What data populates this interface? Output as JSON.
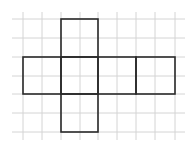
{
  "diagram": {
    "type": "cube-net-on-grid",
    "grid": {
      "vertical_x": [
        23,
        42,
        61,
        80,
        98,
        117,
        136,
        155,
        175
      ],
      "horizontal_y": [
        19,
        38,
        57,
        76,
        94,
        113,
        132
      ],
      "x_extent": [
        12,
        185
      ],
      "y_extent": [
        12,
        140
      ],
      "color": "#d4d4d4"
    },
    "net": {
      "stroke": "#2a2a2a",
      "faces": [
        {
          "name": "top",
          "x": 61,
          "y": 19,
          "w": 37,
          "h": 38
        },
        {
          "name": "left",
          "x": 23,
          "y": 57,
          "w": 38,
          "h": 37
        },
        {
          "name": "center",
          "x": 61,
          "y": 57,
          "w": 37,
          "h": 37
        },
        {
          "name": "right",
          "x": 98,
          "y": 57,
          "w": 38,
          "h": 37
        },
        {
          "name": "far-right",
          "x": 136,
          "y": 57,
          "w": 39,
          "h": 37
        },
        {
          "name": "bottom",
          "x": 61,
          "y": 94,
          "w": 37,
          "h": 38
        }
      ]
    }
  }
}
